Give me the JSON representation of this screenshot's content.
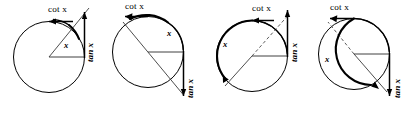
{
  "figure": {
    "background_color": "#ffffff",
    "stroke_color": "#000000",
    "panel_count": 4,
    "panels": [
      {
        "id": "panel-1",
        "quadrant": "first",
        "cot_label": "cot x",
        "tan_label": "tan x",
        "angle_label": "x",
        "angle_degrees": 55,
        "description": "acute angle, tan and cot both positive"
      },
      {
        "id": "panel-2",
        "quadrant": "second",
        "cot_label": "cot x",
        "tan_label": "tan x",
        "angle_label": "x",
        "angle_degrees": 125,
        "description": "obtuse angle, tan and cot both negative"
      },
      {
        "id": "panel-3",
        "quadrant": "third",
        "cot_label": "cot x",
        "tan_label": "tan x",
        "angle_label": "x",
        "angle_degrees": 230,
        "description": "third quadrant angle, tan and cot both positive"
      },
      {
        "id": "panel-4",
        "quadrant": "fourth",
        "cot_label": "cot x",
        "tan_label": "tan x",
        "angle_label": "x",
        "angle_degrees": 305,
        "description": "fourth quadrant angle, tan and cot both negative"
      }
    ]
  }
}
